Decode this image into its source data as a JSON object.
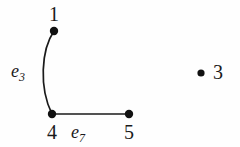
{
  "figure": {
    "kind": "graph-diagram",
    "background_color": "#fefefe",
    "ink_color": "#1a1a1a",
    "width": 240,
    "height": 147
  },
  "vertices": [
    {
      "id": "v1",
      "label": "1",
      "x": 54,
      "y": 31,
      "dot_radius": 4.2
    },
    {
      "id": "v4",
      "label": "4",
      "x": 52,
      "y": 114,
      "dot_radius": 4.2
    },
    {
      "id": "v5",
      "label": "5",
      "x": 129,
      "y": 114,
      "dot_radius": 4.2
    },
    {
      "id": "v3",
      "label": "3",
      "x": 201,
      "y": 73,
      "dot_radius": 3.6
    }
  ],
  "edges": [
    {
      "id": "e3",
      "label_base": "e",
      "label_sub": "3",
      "from": "v1",
      "to": "v4",
      "shape": "curved",
      "path": "M 54 31 C 41 50, 39 88, 52 114",
      "stroke_width": 1.7
    },
    {
      "id": "e7",
      "label_base": "e",
      "label_sub": "7",
      "from": "v4",
      "to": "v5",
      "shape": "straight",
      "path": "M 52 114 L 129 114",
      "stroke_width": 1.7
    }
  ],
  "labels": {
    "v1": "1",
    "v4": "4",
    "v5": "5",
    "v3": "3",
    "e3_base": "e",
    "e3_sub": "3",
    "e7_base": "e",
    "e7_sub": "7"
  }
}
